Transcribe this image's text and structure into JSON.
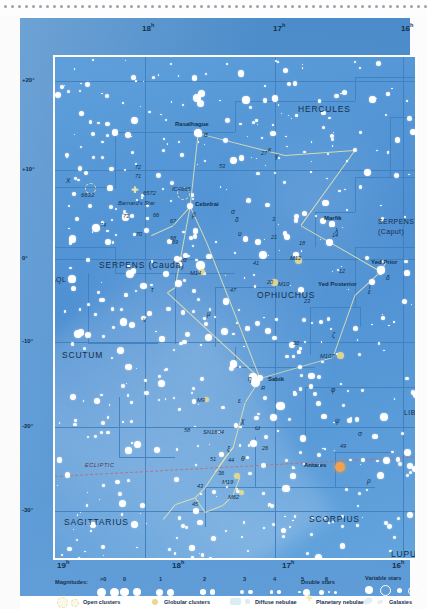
{
  "chart_data": {
    "type": "scatter",
    "xlabel": "Right Ascension",
    "ylabel": "Declination",
    "xlim": [
      "19h",
      "16h"
    ],
    "ylim": [
      -35,
      25
    ],
    "grid": true,
    "ra_ticks_top": [
      "18",
      "17",
      "16"
    ],
    "ra_ticks_bottom": [
      "19",
      "18",
      "17",
      "16"
    ],
    "dec_ticks_left": [
      "+20°",
      "+10°",
      "0°",
      "-10°",
      "-20°",
      "-30°"
    ],
    "dec_ticks_right": [
      "+20°",
      "+10°",
      "0°",
      "-10°",
      "-20°",
      "-30°"
    ],
    "ecliptic_label": "ECLIPTIC",
    "constellations": [
      {
        "name": "HERCULES",
        "x": 276,
        "y": 84
      },
      {
        "name": "SERPENS",
        "x": 356,
        "y": 198
      },
      {
        "name": "(Caput)",
        "x": 356,
        "y": 208
      },
      {
        "name": "SERPENS (Cauda)",
        "x": 77,
        "y": 240
      },
      {
        "name": "AQL",
        "x": 29,
        "y": 256
      },
      {
        "name": "SCUTUM",
        "x": 40,
        "y": 330
      },
      {
        "name": "OPHIUCHUS",
        "x": 235,
        "y": 270
      },
      {
        "name": "SAGITTARIUS",
        "x": 42,
        "y": 497
      },
      {
        "name": "SCORPIUS",
        "x": 287,
        "y": 494
      },
      {
        "name": "LUPUS",
        "x": 369,
        "y": 529
      },
      {
        "name": "LIB",
        "x": 382,
        "y": 389
      }
    ],
    "named_stars": [
      {
        "name": "Rasalhague",
        "greek": "α",
        "x": 176,
        "y": 113,
        "mag": 2.1,
        "color": "white"
      },
      {
        "name": "Cebalrai",
        "greek": "β",
        "x": 168,
        "y": 186,
        "mag": 2.8,
        "color": "white"
      },
      {
        "name": "Marfik",
        "greek": "λ",
        "x": 310,
        "y": 204,
        "mag": 3.8,
        "color": "white"
      },
      {
        "name": "Yed Prior",
        "greek": "δ",
        "x": 359,
        "y": 250,
        "mag": 2.7,
        "color": "white"
      },
      {
        "name": "Yed Posterior",
        "greek": "ε",
        "x": 350,
        "y": 262,
        "mag": 3.2,
        "color": "white"
      },
      {
        "name": "Sabik",
        "greek": "η",
        "x": 238,
        "y": 358,
        "mag": 2.4,
        "color": "white"
      },
      {
        "name": "Antares",
        "greek": "",
        "x": 318,
        "y": 447,
        "mag": 1.0,
        "color": "orange"
      },
      {
        "name": "Barnard's Star",
        "greek": "",
        "x": 118,
        "y": 184,
        "mag": 9.5,
        "color": "white"
      }
    ],
    "deep_sky": [
      {
        "label": "M12",
        "kind": "globular",
        "x": 276,
        "y": 240
      },
      {
        "label": "M10",
        "kind": "globular",
        "x": 252,
        "y": 262
      },
      {
        "label": "M14",
        "kind": "globular",
        "x": 180,
        "y": 252
      },
      {
        "label": "M107",
        "kind": "globular",
        "x": 318,
        "y": 335
      },
      {
        "label": "M9",
        "kind": "globular",
        "x": 184,
        "y": 379
      },
      {
        "label": "M19",
        "kind": "globular",
        "x": 215,
        "y": 456
      },
      {
        "label": "M62",
        "kind": "globular",
        "x": 219,
        "y": 472
      },
      {
        "label": "6633",
        "kind": "open",
        "x": 67,
        "y": 167
      },
      {
        "label": "IC4665",
        "kind": "open",
        "x": 160,
        "y": 172
      },
      {
        "label": "6572",
        "kind": "planetary",
        "x": 113,
        "y": 172
      },
      {
        "label": "SN1604",
        "kind": "supernova",
        "x": 190,
        "y": 410
      },
      {
        "label": "R",
        "kind": "variable",
        "x": 239,
        "y": 367
      }
    ],
    "flamsteed": [
      "72",
      "71",
      "73",
      "74",
      "70",
      "66",
      "67",
      "68",
      "69",
      "53",
      "27",
      "41",
      "47",
      "21",
      "14",
      "12",
      "20",
      "23",
      "30",
      "26",
      "36",
      "43",
      "44",
      "45",
      "51",
      "58",
      "3"
    ],
    "greek_labels": [
      "κ",
      "γ",
      "ν",
      "τ",
      "μ",
      "υ",
      "ζ",
      "ψ",
      "χ",
      "φ",
      "σ",
      "θ",
      "ξ",
      "ρ",
      "ω",
      "X"
    ]
  },
  "axes": {
    "ra_top": [
      {
        "h": "18",
        "sup": "h",
        "x": 122
      },
      {
        "h": "17",
        "sup": "h",
        "x": 253
      },
      {
        "h": "16",
        "sup": "h",
        "x": 381
      }
    ],
    "ra_bottom": [
      {
        "h": "19",
        "sup": "h",
        "x": 37
      },
      {
        "h": "18",
        "sup": "h",
        "x": 152
      },
      {
        "h": "17",
        "sup": "h",
        "x": 262
      },
      {
        "h": "16",
        "sup": "h",
        "x": 372
      }
    ],
    "dec_left": [
      {
        "t": "+20°",
        "y": 59
      },
      {
        "t": "+10°",
        "y": 148
      },
      {
        "t": "0°",
        "y": 237
      },
      {
        "t": "-10°",
        "y": 320
      },
      {
        "t": "-20°",
        "y": 405
      },
      {
        "t": "-30°",
        "y": 489
      }
    ],
    "dec_right": [
      {
        "t": "+20°",
        "y": 59
      },
      {
        "t": "+10°",
        "y": 148
      },
      {
        "t": "0°",
        "y": 237
      },
      {
        "t": "-10°",
        "y": 320
      },
      {
        "t": "-20°",
        "y": 405
      },
      {
        "t": "-30°",
        "y": 489
      }
    ]
  },
  "legend": {
    "magnitudes_label": "Magnitudes:",
    "magnitude_ticks": [
      {
        "t": ">0",
        "x": 47
      },
      {
        "t": "0",
        "x": 70
      },
      {
        "t": "1",
        "x": 106
      },
      {
        "t": "2",
        "x": 150
      },
      {
        "t": "3",
        "x": 190
      },
      {
        "t": "4",
        "x": 220
      },
      {
        "t": "5",
        "x": 248
      },
      {
        "t": "6",
        "x": 272
      }
    ],
    "double_stars": "Double stars",
    "variable_stars": "Variable stars",
    "open_clusters": "Open clusters",
    "globular_clusters": "Globular clusters",
    "diffuse_nebulae": "Diffuse nebulae",
    "planetary_nebulae": "Planetary nebulae",
    "galaxies": "Galaxies"
  },
  "colors": {
    "sky": "#4e91d3",
    "card": "#4f93d4",
    "grid": "#3d7cba",
    "constellation_line": "#e8e4ae",
    "ecliptic": "#c06a6a",
    "star": "#ffffff",
    "antares": "#f0a24e",
    "globular": "#ead98a",
    "label_text": "#16314f"
  }
}
